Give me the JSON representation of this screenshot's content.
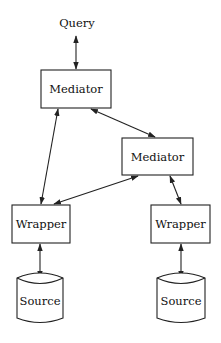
{
  "diagram": {
    "type": "architecture",
    "nodes": {
      "query": {
        "label": "Query"
      },
      "mediator_top": {
        "label": "Mediator"
      },
      "mediator_right": {
        "label": "Mediator"
      },
      "wrapper_left": {
        "label": "Wrapper"
      },
      "wrapper_right": {
        "label": "Wrapper"
      },
      "source_left": {
        "label": "Source"
      },
      "source_right": {
        "label": "Source"
      }
    },
    "edges": [
      {
        "from": "query",
        "to": "mediator_top",
        "direction": "bidirectional"
      },
      {
        "from": "mediator_top",
        "to": "mediator_right",
        "direction": "bidirectional"
      },
      {
        "from": "mediator_top",
        "to": "wrapper_left",
        "direction": "bidirectional"
      },
      {
        "from": "mediator_right",
        "to": "wrapper_left",
        "direction": "bidirectional"
      },
      {
        "from": "mediator_right",
        "to": "wrapper_right",
        "direction": "bidirectional"
      },
      {
        "from": "wrapper_left",
        "to": "source_left",
        "direction": "bidirectional"
      },
      {
        "from": "wrapper_right",
        "to": "source_right",
        "direction": "bidirectional"
      }
    ],
    "colors": {
      "stroke": "#222222",
      "background": "#ffffff",
      "text": "#111111"
    }
  }
}
